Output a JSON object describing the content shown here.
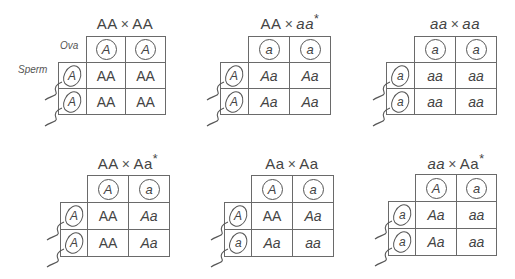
{
  "labels": {
    "ova": "Ova",
    "sperm": "Sperm"
  },
  "crosses": [
    {
      "title_left": "AA",
      "times": "×",
      "title_right": "AA",
      "asterisk": "",
      "ova": [
        "A",
        "A"
      ],
      "sperm": [
        "A",
        "A"
      ],
      "offspring": [
        [
          "AA",
          "AA"
        ],
        [
          "AA",
          "AA"
        ]
      ]
    },
    {
      "title_left": "AA",
      "times": "×",
      "title_right": "aa",
      "asterisk": "*",
      "ova": [
        "a",
        "a"
      ],
      "sperm": [
        "A",
        "A"
      ],
      "offspring": [
        [
          "Aa",
          "Aa"
        ],
        [
          "Aa",
          "Aa"
        ]
      ]
    },
    {
      "title_left": "aa",
      "times": "×",
      "title_right": "aa",
      "asterisk": "",
      "ova": [
        "a",
        "a"
      ],
      "sperm": [
        "a",
        "a"
      ],
      "offspring": [
        [
          "aa",
          "aa"
        ],
        [
          "aa",
          "aa"
        ]
      ]
    },
    {
      "title_left": "AA",
      "times": "×",
      "title_right": "Aa",
      "asterisk": "*",
      "ova": [
        "A",
        "a"
      ],
      "sperm": [
        "A",
        "A"
      ],
      "offspring": [
        [
          "AA",
          "Aa"
        ],
        [
          "AA",
          "Aa"
        ]
      ]
    },
    {
      "title_left": "Aa",
      "times": "×",
      "title_right": "Aa",
      "asterisk": "",
      "ova": [
        "A",
        "a"
      ],
      "sperm": [
        "A",
        "a"
      ],
      "offspring": [
        [
          "AA",
          "Aa"
        ],
        [
          "Aa",
          "aa"
        ]
      ]
    },
    {
      "title_left": "aa",
      "times": "×",
      "title_right": "Aa",
      "asterisk": "*",
      "ova": [
        "A",
        "a"
      ],
      "sperm": [
        "a",
        "a"
      ],
      "offspring": [
        [
          "Aa",
          "aa"
        ],
        [
          "Aa",
          "aa"
        ]
      ]
    }
  ]
}
